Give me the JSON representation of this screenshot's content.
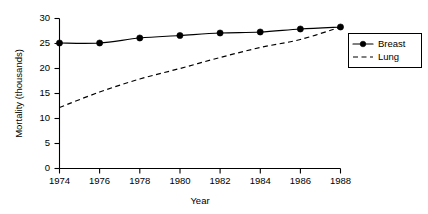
{
  "chart_data": {
    "type": "line",
    "title": "",
    "xlabel": "Year",
    "ylabel": "Mortality (thousands)",
    "x": [
      1974,
      1976,
      1978,
      1980,
      1982,
      1984,
      1986,
      1988
    ],
    "xticklabels": [
      "1974",
      "1976",
      "1978",
      "1980",
      "1982",
      "1984",
      "1986",
      "1988"
    ],
    "yticks": [
      0,
      5,
      10,
      15,
      20,
      25,
      30
    ],
    "yticklabels": [
      "0",
      "5",
      "10",
      "15",
      "20",
      "25",
      "30"
    ],
    "xlim": [
      1974,
      1988
    ],
    "ylim": [
      0,
      30
    ],
    "grid": false,
    "legend_position": "right-outside",
    "series": [
      {
        "name": "Breast",
        "style": "solid",
        "marker": "filled-circle",
        "values": [
          25.1,
          25.1,
          26.1,
          26.6,
          27.1,
          27.3,
          27.9,
          28.3
        ]
      },
      {
        "name": "Lung",
        "style": "dashed",
        "marker": "none",
        "values": [
          12.2,
          15.3,
          17.9,
          20.0,
          22.2,
          24.2,
          25.8,
          28.3
        ]
      }
    ]
  },
  "legend": {
    "entries": [
      {
        "label": "Breast"
      },
      {
        "label": "Lung"
      }
    ]
  },
  "axes": {
    "x_title": "Year",
    "y_title": "Mortality (thousands)"
  }
}
